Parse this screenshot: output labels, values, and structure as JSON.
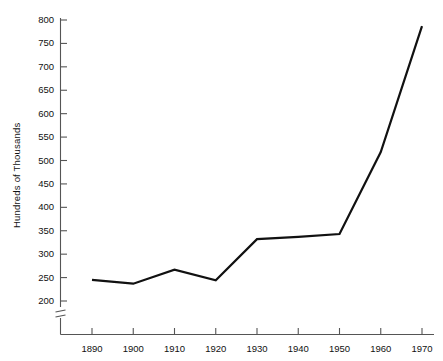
{
  "chart_data": {
    "type": "line",
    "title": "",
    "xlabel": "",
    "ylabel": "Hundreds of Thousands",
    "x": [
      1890,
      1900,
      1910,
      1920,
      1930,
      1940,
      1950,
      1960,
      1970
    ],
    "values": [
      245,
      237,
      267,
      244,
      332,
      337,
      343,
      518,
      787
    ],
    "xtick_labels": [
      "1890",
      "1900",
      "1910",
      "1920",
      "1930",
      "1940",
      "1950",
      "1960",
      "1970"
    ],
    "ytick_labels": [
      "200",
      "250",
      "300",
      "350",
      "400",
      "450",
      "500",
      "550",
      "600",
      "650",
      "700",
      "750",
      "800"
    ],
    "ytick_values": [
      200,
      250,
      300,
      350,
      400,
      450,
      500,
      550,
      600,
      650,
      700,
      750,
      800
    ],
    "xlim": [
      1885,
      1975
    ],
    "ylim": [
      200,
      800
    ],
    "grid": false,
    "legend": null,
    "axis_break": {
      "axis": "y",
      "below": 200,
      "symbol": "double-hash"
    },
    "line_color": "#111111",
    "axis_color": "#555555",
    "background_color": "#ffffff"
  }
}
